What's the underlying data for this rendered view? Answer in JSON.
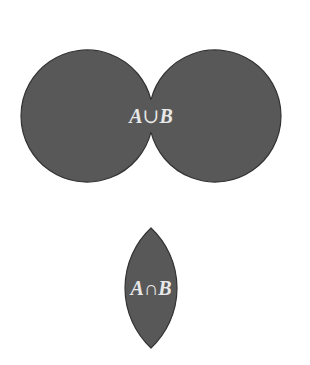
{
  "diagram": {
    "type": "venn",
    "fill_color": "#585858",
    "stroke_color": "#333333",
    "label_color": "#e8e8e8",
    "union": {
      "label_a": "A",
      "label_op": "∪",
      "label_b": "B",
      "circles": [
        {
          "set": "A",
          "cx": 87,
          "cy": 116,
          "r": 66
        },
        {
          "set": "B",
          "cx": 215,
          "cy": 116,
          "r": 66
        }
      ]
    },
    "intersection": {
      "label_a": "A",
      "label_op": "∩",
      "label_b": "B",
      "lens": {
        "cx": 151,
        "top": 228,
        "bottom": 348,
        "half_width": 26
      }
    }
  }
}
